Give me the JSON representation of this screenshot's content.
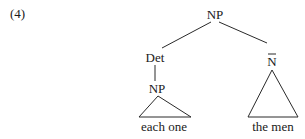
{
  "example_number": "(4)",
  "tree": {
    "root": {
      "label": "NP",
      "x": 215,
      "y": 19
    },
    "det": {
      "label": "Det",
      "x": 155,
      "y": 62
    },
    "nbar": {
      "label": "N",
      "bar": true,
      "x": 272,
      "y": 64
    },
    "inner_np": {
      "label": "NP",
      "x": 157,
      "y": 93
    },
    "left_leaf": {
      "text": "each one",
      "x": 164,
      "y": 131
    },
    "right_leaf": {
      "text": "the men",
      "x": 273,
      "y": 131
    }
  },
  "edges": [
    {
      "from": "root",
      "to": "det",
      "x1": 211,
      "y1": 22,
      "x2": 162,
      "y2": 48
    },
    {
      "from": "root",
      "to": "nbar",
      "x1": 219,
      "y1": 22,
      "x2": 267,
      "y2": 43
    },
    {
      "from": "det",
      "to": "inner_np",
      "x1": 155,
      "y1": 65,
      "x2": 155,
      "y2": 81
    }
  ],
  "triangles": [
    {
      "under": "inner_np",
      "points": "158,96 139,117 191,117"
    },
    {
      "under": "nbar",
      "points": "272,70 248,117 298,117"
    }
  ]
}
